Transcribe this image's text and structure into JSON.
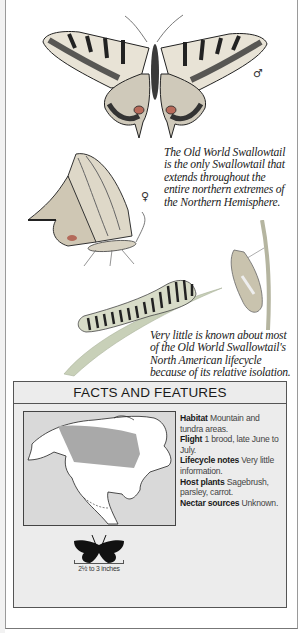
{
  "illustrations": {
    "male_butterfly": {
      "icon": "swallowtail-spread-wings",
      "sex_symbol": "♂"
    },
    "female_butterfly": {
      "icon": "swallowtail-side-view",
      "sex_symbol": "♀"
    },
    "caterpillar": {
      "icon": "caterpillar-on-leaf"
    },
    "chrysalis": {
      "icon": "chrysalis-on-stem"
    }
  },
  "captions": {
    "intro": "The Old World Swallowtail is the only Swallowtail that extends throughout the entire northern extremes of the Northern Hemisphere.",
    "lifecycle": "Very little is known about most of the Old World Swallowtail's North American lifecycle because of its relative isolation."
  },
  "facts": {
    "title": "FACTS AND FEATURES",
    "items": [
      {
        "label": "Habitat",
        "value": "Mountain and tundra areas."
      },
      {
        "label": "Flight",
        "value": "1 brood, late June to July."
      },
      {
        "label": "Lifecycle notes",
        "value": "Very little information."
      },
      {
        "label": "Host plants",
        "value": "Sagebrush, parsley, carrot."
      },
      {
        "label": "Nectar sources",
        "value": "Unknown."
      }
    ],
    "map": {
      "icon": "north-america-range-map",
      "range_color": "#a9a9a9",
      "land_color": "#ffffff",
      "sea_color": "#d9d9d9"
    },
    "size": {
      "icon": "butterfly-silhouette",
      "label": "2½ to 3 inches"
    }
  },
  "colors": {
    "panel_bg": "#ececec",
    "border": "#555555",
    "text": "#1a1a1a"
  }
}
